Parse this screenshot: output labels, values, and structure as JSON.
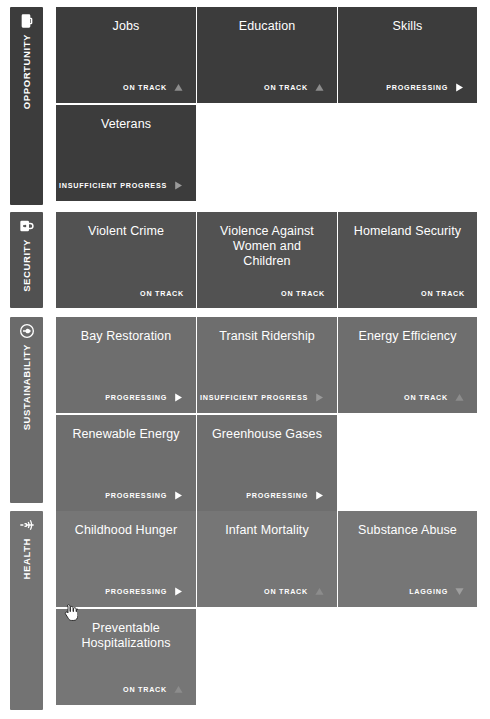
{
  "page": {
    "background_color": "#ffffff"
  },
  "layout": {
    "columns": [
      {
        "left": 56,
        "width": 140
      },
      {
        "left": 197,
        "width": 140
      },
      {
        "left": 338,
        "width": 139
      }
    ],
    "row_height": 96,
    "row_gap": 2
  },
  "status_colors": {
    "on-track": "#8c8c8c",
    "progressing": "#ffffff",
    "insufficient-progress": "#9a9a9a",
    "lagging": "#9e9e9e"
  },
  "sections": [
    {
      "id": "opportunity",
      "label": "OPPORTUNITY",
      "icon": "briefcase-icon",
      "rail_color": "#3c3c3c",
      "tile_color": "#3c3c3c",
      "top": 7,
      "height": 198,
      "rows": [
        [
          {
            "title": "Jobs",
            "status": "ON TRACK",
            "mark": "up-triangle"
          },
          {
            "title": "Education",
            "status": "ON TRACK",
            "mark": "up-triangle"
          },
          {
            "title": "Skills",
            "status": "PROGRESSING",
            "mark": "right-triangle"
          }
        ],
        [
          {
            "title": "Veterans",
            "status": "INSUFFICIENT PROGRESS",
            "mark": "right-triangle"
          }
        ]
      ]
    },
    {
      "id": "security",
      "label": "SECURITY",
      "icon": "lock-icon",
      "rail_color": "#515151",
      "tile_color": "#525252",
      "top": 212,
      "height": 96,
      "rows": [
        [
          {
            "title": "Violent Crime",
            "status": "ON TRACK",
            "mark": "none"
          },
          {
            "title": "Violence Against Women and Children",
            "status": "ON TRACK",
            "mark": "none"
          },
          {
            "title": "Homeland Security",
            "status": "ON TRACK",
            "mark": "none"
          }
        ]
      ]
    },
    {
      "id": "sustainability",
      "label": "SUSTAINABILITY",
      "icon": "leaf-circle-icon",
      "rail_color": "#6b6b6b",
      "tile_color": "#6e6e6e",
      "top": 317,
      "height": 186,
      "rows": [
        [
          {
            "title": "Bay Restoration",
            "status": "PROGRESSING",
            "mark": "right-triangle"
          },
          {
            "title": "Transit Ridership",
            "status": "INSUFFICIENT PROGRESS",
            "mark": "right-triangle"
          },
          {
            "title": "Energy Efficiency",
            "status": "ON TRACK",
            "mark": "up-triangle"
          }
        ],
        [
          {
            "title": "Renewable Energy",
            "status": "PROGRESSING",
            "mark": "right-triangle"
          },
          {
            "title": "Greenhouse Gases",
            "status": "PROGRESSING",
            "mark": "right-triangle"
          }
        ]
      ]
    },
    {
      "id": "health",
      "label": "HEALTH",
      "icon": "caduceus-icon",
      "rail_color": "#737373",
      "tile_color": "#767676",
      "top": 511,
      "height": 199,
      "rows": [
        [
          {
            "title": "Childhood Hunger",
            "status": "PROGRESSING",
            "mark": "right-triangle"
          },
          {
            "title": "Infant Mortality",
            "status": "ON TRACK",
            "mark": "up-triangle"
          },
          {
            "title": "Substance Abuse",
            "status": "LAGGING",
            "mark": "down-triangle"
          }
        ],
        [
          {
            "title": "Preventable Hospitalizations",
            "status": "ON TRACK",
            "mark": "up-triangle"
          }
        ]
      ]
    }
  ],
  "cursor": {
    "name": "pointing-hand-cursor",
    "x": 62,
    "y": 604
  }
}
